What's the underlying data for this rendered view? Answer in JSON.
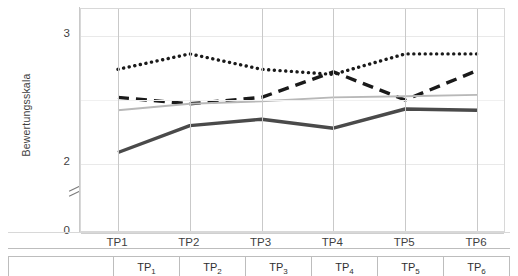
{
  "chart_data": {
    "type": "line",
    "title": "",
    "xlabel": "",
    "ylabel": "Bewertungsskala",
    "categories": [
      "TP1",
      "TP2",
      "TP3",
      "TP4",
      "TP5",
      "TP6"
    ],
    "ylim": [
      0,
      3.2
    ],
    "ytick_labels": [
      "0",
      "2",
      "3"
    ],
    "ytick_values": [
      0,
      2,
      3
    ],
    "axis_break": true,
    "axis_break_between": [
      0,
      2
    ],
    "grid": true,
    "legend": "none",
    "series": [
      {
        "name": "gepunktete Linie",
        "style": "dotted",
        "color": "#1a1a1a",
        "values": [
          2.74,
          2.86,
          2.74,
          2.7,
          2.86,
          2.86
        ]
      },
      {
        "name": "gestrichelte Linie",
        "style": "dashed",
        "color": "#1a1a1a",
        "values": [
          2.52,
          2.47,
          2.52,
          2.72,
          2.5,
          2.73
        ]
      },
      {
        "name": "duenne graue Linie",
        "style": "solid-thin",
        "color": "#b8b8b8",
        "values": [
          2.42,
          2.47,
          2.49,
          2.52,
          2.53,
          2.54
        ]
      },
      {
        "name": "dicke dunkle Linie",
        "style": "solid-thick",
        "color": "#4a4a4a",
        "values": [
          2.09,
          2.3,
          2.35,
          2.28,
          2.43,
          2.42
        ]
      }
    ]
  },
  "table": {
    "corner_label": "",
    "headers": [
      "TP",
      "TP",
      "TP",
      "TP",
      "TP",
      "TP"
    ],
    "header_subscripts": [
      "1",
      "2",
      "3",
      "4",
      "5",
      "6"
    ]
  }
}
